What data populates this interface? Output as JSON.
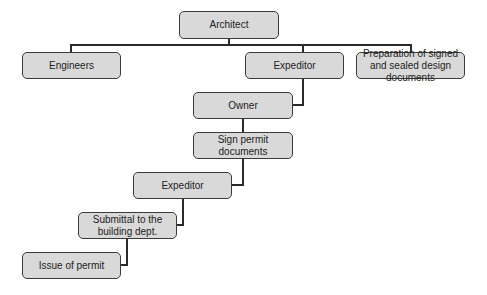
{
  "diagram": {
    "type": "flowchart",
    "nodes": {
      "architect": "Architect",
      "engineers": "Engineers",
      "expeditor_top": "Expeditor",
      "preparation": "Preparation of signed and sealed design documents",
      "owner": "Owner",
      "sign_permit": "Sign permit documents",
      "expeditor_bottom": "Expeditor",
      "submittal": "Submittal to the building dept.",
      "issue": "Issue of permit"
    },
    "edges": [
      [
        "Architect",
        "Engineers"
      ],
      [
        "Architect",
        "Expeditor"
      ],
      [
        "Architect",
        "Preparation of signed and sealed design documents"
      ],
      [
        "Expeditor",
        "Owner"
      ],
      [
        "Owner",
        "Sign permit documents"
      ],
      [
        "Sign permit documents",
        "Expeditor"
      ],
      [
        "Expeditor",
        "Submittal to the building dept."
      ],
      [
        "Submittal to the building dept.",
        "Issue of permit"
      ]
    ]
  }
}
